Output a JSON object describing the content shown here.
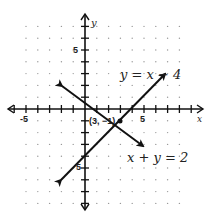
{
  "chart_data": {
    "type": "line",
    "title": "",
    "xlabel": "x",
    "ylabel": "y",
    "xlim": [
      -6,
      8
    ],
    "ylim": [
      -8,
      8
    ],
    "grid": "dotted",
    "x_tick_labels": [
      "-5",
      "5"
    ],
    "y_tick_labels": [
      "5",
      "-5"
    ],
    "series": [
      {
        "name": "y = x - 4",
        "equation": "y = x - 4",
        "points": [
          [
            -2,
            -6
          ],
          [
            7,
            3
          ]
        ]
      },
      {
        "name": "x + y = 2",
        "equation": "x + y = 2",
        "points": [
          [
            -2,
            4
          ],
          [
            5,
            -3
          ]
        ]
      }
    ],
    "annotations": [
      {
        "text": "(3, -1)",
        "x": 3,
        "y": -1,
        "note": "intersection point"
      }
    ]
  },
  "labels": {
    "eq1": "y = x − 4",
    "eq2": "x + y = 2",
    "point": "(3, −1)",
    "x_axis": "x",
    "y_axis": "y",
    "xtick_neg": "-5",
    "xtick_pos": "5",
    "ytick_pos": "5",
    "ytick_neg": "5"
  }
}
